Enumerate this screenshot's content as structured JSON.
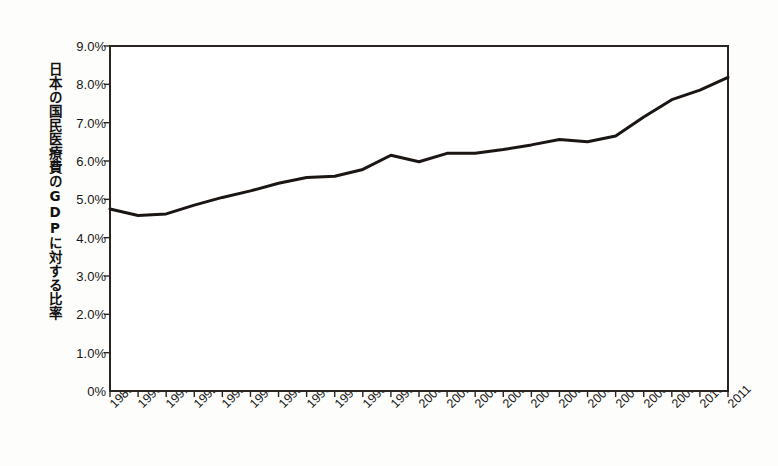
{
  "chart_data": {
    "type": "line",
    "title": "",
    "xlabel": "",
    "ylabel": "日本の国民医療費のGDPに対する比率",
    "categories": [
      "1989",
      "1990",
      "1991",
      "1992",
      "1993",
      "1994",
      "1995",
      "1996",
      "1997",
      "1998",
      "1999",
      "2000",
      "2001",
      "2002",
      "2003",
      "2004",
      "2005",
      "2006",
      "2007",
      "2008",
      "2009",
      "2010",
      "2011"
    ],
    "values": [
      4.75,
      4.58,
      4.62,
      4.85,
      5.05,
      5.22,
      5.42,
      5.57,
      5.6,
      5.78,
      6.15,
      5.98,
      6.2,
      6.2,
      6.3,
      6.42,
      6.56,
      6.5,
      6.65,
      7.15,
      7.6,
      7.85,
      8.18
    ],
    "unit": "%",
    "ylim": [
      0,
      9
    ],
    "ytick_values": [
      0,
      1,
      2,
      3,
      4,
      5,
      6,
      7,
      8,
      9
    ],
    "ytick_labels": [
      "0%",
      "1.0%",
      "2.0%",
      "3.0%",
      "4.0%",
      "5.0%",
      "6.0%",
      "7.0%",
      "8.0%",
      "9.0%"
    ],
    "grid": false,
    "legend": "none",
    "series_color": "#1b1613",
    "axis_color": "#2a2420",
    "plot_background": "#ffffff",
    "page_background": "#fdfdfb"
  },
  "axis": {
    "y_title": "日本の国民医療費のGDPに対する比率"
  }
}
